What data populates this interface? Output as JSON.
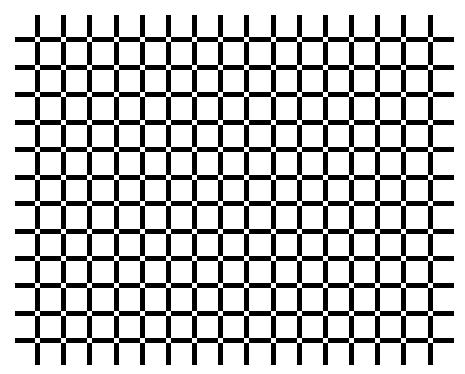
{
  "figure": {
    "name": "scintillating-grid-illusion",
    "background_color": "#ffffff",
    "line_color": "#000000",
    "dot_color": "#ffffff",
    "line_thickness": 5,
    "dot_size": 5,
    "horizontal_lines": {
      "count": 12,
      "y_centers": [
        39,
        67,
        94,
        122,
        149,
        177,
        203,
        231,
        258,
        285,
        313,
        340
      ],
      "x_start": 15,
      "x_end": 454
    },
    "vertical_lines": {
      "count": 16,
      "x_centers": [
        37,
        63,
        89,
        116,
        142,
        168,
        194,
        220,
        246,
        273,
        299,
        325,
        351,
        377,
        403,
        430
      ],
      "y_start": 15,
      "y_end": 365
    }
  }
}
